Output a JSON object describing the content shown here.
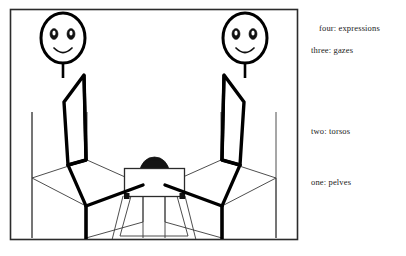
{
  "figure": {
    "frame": {
      "stroke_color": "#2b2b2b",
      "fill_color": "#ffffff"
    },
    "ink_color": "#000000",
    "thin_line_color": "#3a3a3a",
    "annotations": [
      {
        "id": "four",
        "level": "four",
        "term": "expressions",
        "text": "four: expressions"
      },
      {
        "id": "three",
        "level": "three",
        "term": "gazes",
        "text": "three: gazes"
      },
      {
        "id": "two",
        "level": "two",
        "term": "torsos",
        "text": "two: torsos"
      },
      {
        "id": "one",
        "level": "one",
        "term": "pelves",
        "text": "one: pelves"
      }
    ],
    "elements": {
      "left_figure": "seated stick figure facing right",
      "right_figure": "seated stick figure facing left",
      "center_head": "third person head behind table",
      "table": "small table with splayed legs",
      "left_chair": "chair under left figure",
      "right_chair": "chair under right figure"
    }
  }
}
